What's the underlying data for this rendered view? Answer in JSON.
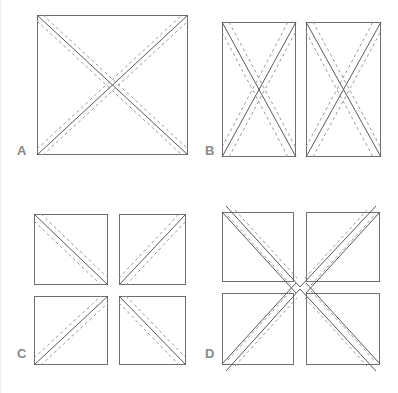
{
  "figure": {
    "background_color": "#ffffff",
    "outline_color": "#6e6e6e",
    "seam_solid_color": "#5a5a5a",
    "seam_dash_color": "#9a9a9a",
    "label_color": "#8a8a8a",
    "width": 398,
    "height": 393
  },
  "panels": [
    {
      "id": "A",
      "label": "A",
      "label_x": 17,
      "label_y": 155,
      "description": "one full square with both diagonals marked",
      "shapes": [
        {
          "name": "square",
          "x": 37,
          "y": 15,
          "w": 151,
          "h": 140
        }
      ],
      "seams": [
        {
          "name": "diagonal-tl-br",
          "x1": 37,
          "y1": 15,
          "x2": 188,
          "y2": 155
        },
        {
          "name": "diagonal-bl-tr",
          "x1": 37,
          "y1": 155,
          "x2": 188,
          "y2": 15
        }
      ]
    },
    {
      "id": "B",
      "label": "B",
      "label_x": 205,
      "label_y": 155,
      "description": "square cut into two vertical halves, each half with both diagonals",
      "shapes": [
        {
          "name": "left-half",
          "x": 222,
          "y": 22,
          "w": 74,
          "h": 135
        },
        {
          "name": "right-half",
          "x": 306,
          "y": 22,
          "w": 75,
          "h": 135
        }
      ],
      "seams": [
        {
          "name": "left-diagonal-tl-br",
          "x1": 222,
          "y1": 22,
          "x2": 296,
          "y2": 157
        },
        {
          "name": "left-diagonal-bl-tr",
          "x1": 222,
          "y1": 157,
          "x2": 296,
          "y2": 22
        },
        {
          "name": "right-diagonal-tl-br",
          "x1": 306,
          "y1": 22,
          "x2": 381,
          "y2": 157
        },
        {
          "name": "right-diagonal-bl-tr",
          "x1": 306,
          "y1": 157,
          "x2": 381,
          "y2": 22
        }
      ]
    },
    {
      "id": "C",
      "label": "C",
      "label_x": 17,
      "label_y": 358,
      "description": "four separate squares each with a single diagonal, mirrored in a pinwheel",
      "shapes": [
        {
          "name": "square-top-left",
          "x": 34,
          "y": 214,
          "w": 74,
          "h": 71
        },
        {
          "name": "square-top-right",
          "x": 119,
          "y": 214,
          "w": 67,
          "h": 71
        },
        {
          "name": "square-bottom-left",
          "x": 34,
          "y": 296,
          "w": 74,
          "h": 69
        },
        {
          "name": "square-bottom-right",
          "x": 119,
          "y": 296,
          "w": 67,
          "h": 69
        }
      ],
      "seams": [
        {
          "name": "tl-diagonal",
          "x1": 34,
          "y1": 214,
          "x2": 108,
          "y2": 285
        },
        {
          "name": "tr-diagonal",
          "x1": 119,
          "y1": 285,
          "x2": 186,
          "y2": 214
        },
        {
          "name": "bl-diagonal",
          "x1": 34,
          "y1": 365,
          "x2": 108,
          "y2": 296
        },
        {
          "name": "br-diagonal",
          "x1": 119,
          "y1": 296,
          "x2": 186,
          "y2": 365
        }
      ]
    },
    {
      "id": "D",
      "label": "D",
      "label_x": 205,
      "label_y": 358,
      "description": "four squares arranged in a pinwheel with diagonals extending past the inner corners",
      "shapes": [
        {
          "name": "square-top-left",
          "x": 222,
          "y": 212,
          "w": 72,
          "h": 70
        },
        {
          "name": "square-top-right",
          "x": 306,
          "y": 212,
          "w": 74,
          "h": 70
        },
        {
          "name": "square-bottom-left",
          "x": 222,
          "y": 293,
          "w": 72,
          "h": 72
        },
        {
          "name": "square-bottom-right",
          "x": 306,
          "y": 293,
          "w": 74,
          "h": 72
        }
      ],
      "seams": [
        {
          "name": "tl-diagonal-extended",
          "x1": 226,
          "y1": 206,
          "x2": 300,
          "y2": 287
        },
        {
          "name": "tr-diagonal-extended",
          "x1": 300,
          "y1": 287,
          "x2": 376,
          "y2": 206
        },
        {
          "name": "bl-diagonal-extended",
          "x1": 226,
          "y1": 371,
          "x2": 300,
          "y2": 289
        },
        {
          "name": "br-diagonal-extended",
          "x1": 300,
          "y1": 289,
          "x2": 376,
          "y2": 371
        }
      ]
    }
  ]
}
